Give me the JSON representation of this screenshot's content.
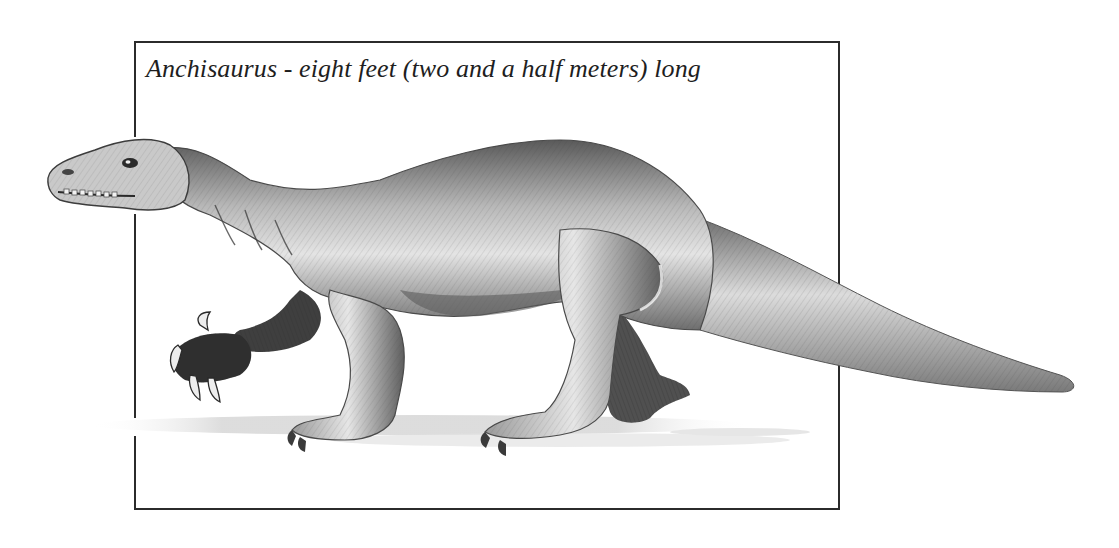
{
  "caption": "Anchisaurus - eight feet (two and a half meters) long",
  "illustration": {
    "subject": "Anchisaurus",
    "style": "pencil sketch",
    "palette": {
      "ink": "#2b2b2b",
      "shade_dark": "#4a4a4a",
      "shade_mid": "#8c8c8c",
      "shade_light": "#d6d6d6",
      "paper": "#ffffff"
    }
  },
  "frame": {
    "left": 134,
    "top": 42,
    "right": 839,
    "bottom": 509
  }
}
